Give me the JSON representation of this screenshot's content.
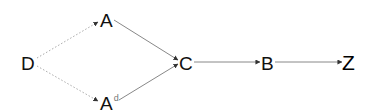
{
  "diagram": {
    "type": "directed-graph",
    "nodes": [
      {
        "id": "D",
        "label": "D",
        "superscript": null,
        "x": 28,
        "y": 62
      },
      {
        "id": "A",
        "label": "A",
        "superscript": null,
        "x": 106,
        "y": 19
      },
      {
        "id": "Ad",
        "label": "A",
        "superscript": "d",
        "x": 106,
        "y": 103
      },
      {
        "id": "C",
        "label": "C",
        "superscript": null,
        "x": 186,
        "y": 62
      },
      {
        "id": "B",
        "label": "B",
        "superscript": null,
        "x": 267,
        "y": 62
      },
      {
        "id": "Z",
        "label": "Z",
        "superscript": null,
        "x": 349,
        "y": 62
      }
    ],
    "edges": [
      {
        "from": "D",
        "to": "A",
        "style": "dotted"
      },
      {
        "from": "D",
        "to": "Ad",
        "style": "dotted"
      },
      {
        "from": "A",
        "to": "C",
        "style": "solid"
      },
      {
        "from": "Ad",
        "to": "C",
        "style": "solid"
      },
      {
        "from": "C",
        "to": "B",
        "style": "solid"
      },
      {
        "from": "B",
        "to": "Z",
        "style": "solid"
      }
    ],
    "colors": {
      "solid_edge": "#888888",
      "dotted_edge": "#aaaaaa",
      "arrowhead": "#333333",
      "node_text": "#111111",
      "superscript": "#777777"
    }
  }
}
